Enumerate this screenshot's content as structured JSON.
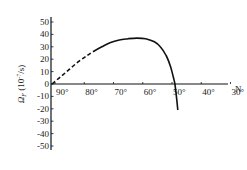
{
  "chart_data": {
    "type": "line",
    "title": "",
    "xlabel": "N",
    "ylabel": "Ω_F (10⁻⁷/s)",
    "ylabel_main": "Ω",
    "ylabel_sub": "F",
    "ylabel_unit_prefix": " (10",
    "ylabel_unit_exp": "-7",
    "ylabel_unit_suffix": "/s)",
    "x_ticks": [
      "90°",
      "80°",
      "70°",
      "60°",
      "50°",
      "40°",
      "30°"
    ],
    "x_tick_values": [
      90,
      80,
      70,
      60,
      50,
      40,
      30
    ],
    "x_axis_reversed": true,
    "y_ticks": [
      "50",
      "40",
      "30",
      "20",
      "10",
      "0",
      "-10",
      "-20",
      "-30",
      "-40",
      "-50"
    ],
    "y_tick_values": [
      50,
      40,
      30,
      20,
      10,
      0,
      -10,
      -20,
      -30,
      -40,
      -50
    ],
    "ylim": [
      -50,
      50
    ],
    "xlim": [
      91,
      27
    ],
    "grid": false,
    "legend": null,
    "series": [
      {
        "name": "dashed (extrapolated)",
        "style": "dashed",
        "x": [
          91,
          88,
          85,
          82,
          79,
          77
        ],
        "y": [
          0,
          6,
          12,
          18,
          23,
          26
        ]
      },
      {
        "name": "solid",
        "style": "solid",
        "x": [
          77,
          74,
          71,
          68,
          65,
          62,
          59,
          56,
          54,
          52,
          50.5,
          49.5,
          49,
          48.5,
          48
        ],
        "y": [
          26,
          30,
          33.5,
          35.5,
          36.5,
          37,
          36.5,
          34,
          30,
          23,
          14,
          5,
          0,
          -10,
          -21
        ]
      }
    ]
  }
}
